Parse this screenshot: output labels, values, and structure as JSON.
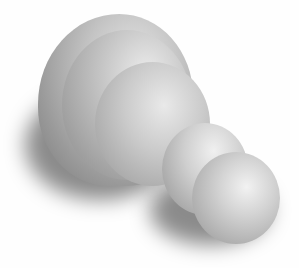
{
  "scene": {
    "description": "Grayscale 3D render of rounded dome and sphere shapes on white background",
    "background_color": "#fefefe",
    "objects": [
      {
        "name": "large-dome-back"
      },
      {
        "name": "large-dome-middle"
      },
      {
        "name": "large-sphere-front"
      },
      {
        "name": "small-sphere-back"
      },
      {
        "name": "small-sphere-front"
      }
    ]
  }
}
